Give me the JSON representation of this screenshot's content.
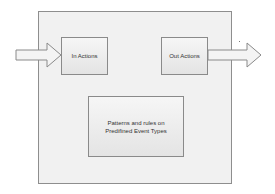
{
  "diagram": {
    "in_box": {
      "label": "In Actions"
    },
    "out_box": {
      "label": "Out Actions"
    },
    "pattern_box": {
      "line1": "Patterns and rules on",
      "line2": "Predifined Event Types"
    },
    "colors": {
      "border": "#8a8a8a",
      "fill": "#eeeeee",
      "text": "#333333"
    }
  }
}
